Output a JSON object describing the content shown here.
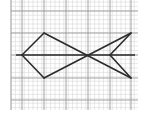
{
  "diagram": {
    "type": "grid-figure",
    "colors": {
      "background": "#ffffff",
      "minor_grid": "#d6d6d6",
      "major_grid": "#9a9a9a",
      "figure": "#2b2b2b"
    },
    "grid": {
      "x_min": 11,
      "x_max": 138,
      "y_min": 0,
      "y_max": 110,
      "minor_step": 4.4,
      "major_x": [
        11,
        22,
        44,
        66,
        88,
        110,
        131
      ],
      "major_y": [
        11,
        33,
        55,
        78,
        100
      ]
    },
    "axis_line": {
      "x1": 16,
      "y1": 55,
      "x2": 135,
      "y2": 55
    },
    "figure_segments": [
      {
        "from": [
          22,
          55
        ],
        "to": [
          44,
          33
        ]
      },
      {
        "from": [
          44,
          33
        ],
        "to": [
          131,
          78
        ]
      },
      {
        "from": [
          131,
          78
        ],
        "to": [
          110,
          55
        ]
      },
      {
        "from": [
          110,
          55
        ],
        "to": [
          131,
          33
        ]
      },
      {
        "from": [
          131,
          33
        ],
        "to": [
          44,
          78
        ]
      },
      {
        "from": [
          44,
          78
        ],
        "to": [
          22,
          55
        ]
      }
    ],
    "vertices": {
      "nose": [
        22,
        55
      ],
      "body_top": [
        44,
        33
      ],
      "body_bottom": [
        44,
        78
      ],
      "crossing": [
        88,
        55
      ],
      "tail_top": [
        131,
        33
      ],
      "tail_bottom": [
        131,
        78
      ],
      "tail_notch": [
        110,
        55
      ]
    }
  }
}
